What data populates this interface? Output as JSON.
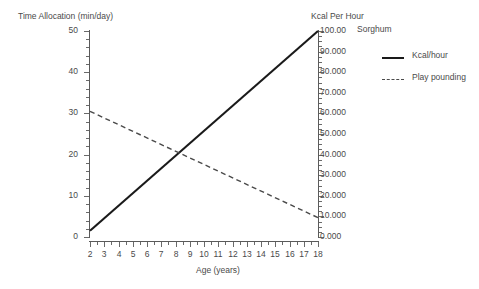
{
  "chart_data": {
    "type": "line",
    "title": "Sorghum",
    "xlabel": "Age (years)",
    "ylabel": "Time Allocation (min/day)",
    "y2label": "Kcal Per Hour",
    "xlim": [
      2,
      18
    ],
    "ylim": [
      0,
      50
    ],
    "y2lim": [
      0,
      100
    ],
    "grid": false,
    "legend_position": "right",
    "x_ticks": [
      2,
      3,
      4,
      5,
      6,
      7,
      8,
      9,
      10,
      11,
      12,
      13,
      14,
      15,
      16,
      17,
      18
    ],
    "x_tick_labels": [
      "2",
      "3",
      "4",
      "5",
      "6",
      "7",
      "8",
      "9",
      "10",
      "11",
      "12",
      "13",
      "14",
      "15",
      "16",
      "17",
      "18"
    ],
    "y_ticks": [
      0,
      10,
      20,
      30,
      40,
      50
    ],
    "y_tick_labels": [
      "0",
      "10",
      "20",
      "30",
      "40",
      "50"
    ],
    "y2_ticks": [
      0,
      10,
      20,
      30,
      40,
      50,
      60,
      70,
      80,
      90,
      100
    ],
    "y2_tick_labels": [
      "0.000",
      "10.000",
      "20.000",
      "30.000",
      "40.000",
      "50.000",
      "60.000",
      "70.000",
      "80.000",
      "90.000",
      "100.00"
    ],
    "series": [
      {
        "name": "Kcal/hour",
        "style": "solid",
        "axis": "right",
        "color": "#1a1a1a",
        "x": [
          2,
          18
        ],
        "values": [
          3.0,
          100.0
        ]
      },
      {
        "name": "Play pounding",
        "style": "dashed",
        "axis": "left",
        "color": "#4a4a4a",
        "x": [
          2,
          18
        ],
        "values": [
          30.5,
          4.7
        ]
      }
    ],
    "intersection": {
      "x": 8.3,
      "y_left": 20.0,
      "y_right": 40.0
    }
  },
  "legend": {
    "items": [
      {
        "label": "Kcal/hour"
      },
      {
        "label": "Play pounding"
      }
    ]
  }
}
